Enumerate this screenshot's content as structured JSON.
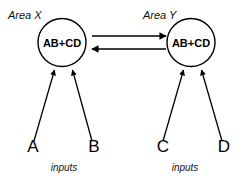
{
  "diagram": {
    "type": "node-link-diagram",
    "background_color": "#ffffff",
    "stroke_color": "#000000",
    "areas": [
      {
        "id": "area-x",
        "label": "Area X",
        "node_label": "AB+CD",
        "inputs_caption": "inputs",
        "inputs": [
          "A",
          "B"
        ]
      },
      {
        "id": "area-y",
        "label": "Area Y",
        "node_label": "AB+CD",
        "inputs_caption": "inputs",
        "inputs": [
          "C",
          "D"
        ]
      }
    ],
    "connections": [
      {
        "id": "x-to-y",
        "from": "area-x",
        "to": "area-y",
        "direction": "right"
      },
      {
        "id": "y-to-x",
        "from": "area-y",
        "to": "area-x",
        "direction": "left"
      }
    ]
  }
}
